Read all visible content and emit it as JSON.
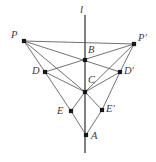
{
  "figure": {
    "width": 156,
    "height": 162,
    "background_color": "#ffffff",
    "stroke_color": "#58585a",
    "axis_color": "#55565a",
    "dot_color": "#18181a",
    "label_color": "#3c3c3e"
  },
  "axis": {
    "name": "mirror-line",
    "label": "l",
    "label_x": 80,
    "label_y": 4,
    "x": 85,
    "y_top": 15,
    "y_bottom": 153
  },
  "points": [
    {
      "id": "P",
      "label": "P",
      "x": 24,
      "y": 41,
      "label_x": 11,
      "label_y": 30
    },
    {
      "id": "Pp",
      "label": "P′",
      "x": 134,
      "y": 44,
      "label_x": 138,
      "label_y": 33
    },
    {
      "id": "B",
      "label": "B",
      "x": 85,
      "y": 60,
      "label_x": 88,
      "label_y": 45
    },
    {
      "id": "D",
      "label": "D",
      "x": 45,
      "y": 72,
      "label_x": 32,
      "label_y": 66
    },
    {
      "id": "Dp",
      "label": "D′",
      "x": 120,
      "y": 72,
      "label_x": 124,
      "label_y": 66
    },
    {
      "id": "C",
      "label": "C",
      "x": 85,
      "y": 92,
      "label_x": 88,
      "label_y": 75
    },
    {
      "id": "E",
      "label": "E",
      "x": 71,
      "y": 111,
      "label_x": 57,
      "label_y": 106
    },
    {
      "id": "Ep",
      "label": "E′",
      "x": 102,
      "y": 110,
      "label_x": 106,
      "label_y": 104
    },
    {
      "id": "A",
      "label": "A",
      "x": 86,
      "y": 135,
      "label_x": 91,
      "label_y": 131
    }
  ],
  "segments": [
    {
      "name": "P-Pprime",
      "from": "P",
      "to": "Pp"
    },
    {
      "name": "P-Dprime",
      "from": "P",
      "to": "Dp"
    },
    {
      "name": "P-C",
      "from": "P",
      "to": "C"
    },
    {
      "name": "P-D",
      "from": "P",
      "to": "D"
    },
    {
      "name": "D-E",
      "from": "D",
      "to": "E"
    },
    {
      "name": "Pprime-D",
      "from": "Pp",
      "to": "D"
    },
    {
      "name": "Pprime-C",
      "from": "Pp",
      "to": "C"
    },
    {
      "name": "Pprime-Dprime",
      "from": "Pp",
      "to": "Dp"
    },
    {
      "name": "Dprime-Eprime",
      "from": "Dp",
      "to": "Ep"
    },
    {
      "name": "D-C",
      "from": "D",
      "to": "C"
    },
    {
      "name": "Dprime-C",
      "from": "Dp",
      "to": "C"
    },
    {
      "name": "E-C",
      "from": "E",
      "to": "C"
    },
    {
      "name": "Eprime-C",
      "from": "Ep",
      "to": "C"
    },
    {
      "name": "E-A",
      "from": "E",
      "to": "A"
    },
    {
      "name": "Eprime-A",
      "from": "Ep",
      "to": "A"
    }
  ]
}
